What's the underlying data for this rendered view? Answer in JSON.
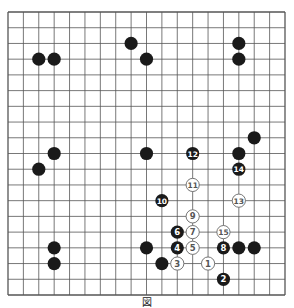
{
  "diagram": {
    "type": "go-board",
    "size": 19,
    "caption": "図",
    "colors": {
      "line": "#555555",
      "black": "#1a1a1a",
      "white": "#ffffff",
      "white_text": "#555555",
      "black_text": "#ffffff"
    },
    "stones": [
      {
        "color": "black",
        "col": 2,
        "row": 3
      },
      {
        "color": "black",
        "col": 3,
        "row": 3
      },
      {
        "color": "black",
        "col": 8,
        "row": 2
      },
      {
        "color": "black",
        "col": 9,
        "row": 3
      },
      {
        "color": "black",
        "col": 15,
        "row": 2
      },
      {
        "color": "black",
        "col": 15,
        "row": 3
      },
      {
        "color": "black",
        "col": 16,
        "row": 8
      },
      {
        "color": "black",
        "col": 3,
        "row": 9
      },
      {
        "color": "black",
        "col": 2,
        "row": 10
      },
      {
        "color": "black",
        "col": 9,
        "row": 9
      },
      {
        "color": "black",
        "col": 15,
        "row": 9
      },
      {
        "color": "black",
        "col": 3,
        "row": 15
      },
      {
        "color": "black",
        "col": 3,
        "row": 16
      },
      {
        "color": "black",
        "col": 9,
        "row": 15
      },
      {
        "color": "black",
        "col": 15,
        "row": 15
      },
      {
        "color": "black",
        "col": 16,
        "row": 15
      },
      {
        "color": "black",
        "col": 10,
        "row": 16
      },
      {
        "color": "white",
        "col": 13,
        "row": 16,
        "label": "1"
      },
      {
        "color": "black",
        "col": 14,
        "row": 17,
        "label": "2"
      },
      {
        "color": "white",
        "col": 11,
        "row": 16,
        "label": "3"
      },
      {
        "color": "black",
        "col": 11,
        "row": 15,
        "label": "4"
      },
      {
        "color": "white",
        "col": 12,
        "row": 15,
        "label": "5"
      },
      {
        "color": "black",
        "col": 11,
        "row": 14,
        "label": "6"
      },
      {
        "color": "white",
        "col": 12,
        "row": 14,
        "label": "7"
      },
      {
        "color": "black",
        "col": 14,
        "row": 15,
        "label": "8"
      },
      {
        "color": "white",
        "col": 12,
        "row": 13,
        "label": "9"
      },
      {
        "color": "black",
        "col": 10,
        "row": 12,
        "label": "10"
      },
      {
        "color": "white",
        "col": 12,
        "row": 11,
        "label": "11"
      },
      {
        "color": "black",
        "col": 12,
        "row": 9,
        "label": "12"
      },
      {
        "color": "white",
        "col": 15,
        "row": 12,
        "label": "13"
      },
      {
        "color": "black",
        "col": 15,
        "row": 10,
        "label": "14"
      },
      {
        "color": "white",
        "col": 14,
        "row": 14,
        "label": "15"
      }
    ]
  }
}
